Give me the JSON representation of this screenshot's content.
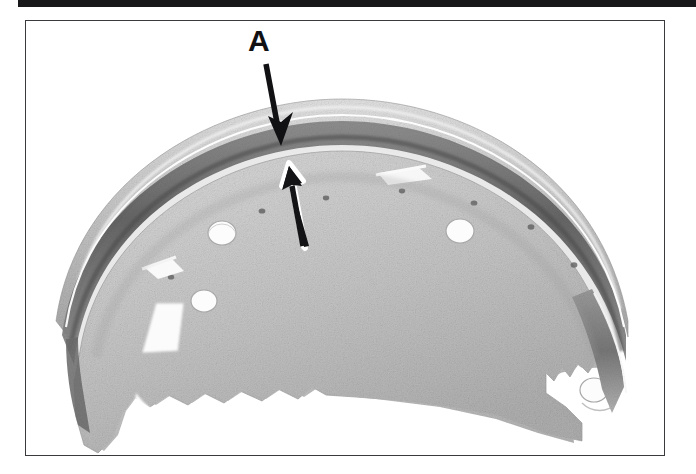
{
  "figure": {
    "kind": "photograph",
    "caption_visible": false,
    "callouts": [
      {
        "id": "A",
        "label": "A",
        "label_x": 262,
        "label_y": 42,
        "arrows": [
          {
            "name": "callout-a-down-arrow",
            "direction": "down",
            "style": "solid-black",
            "from_x": 266,
            "from_y": 64,
            "to_x": 281,
            "to_y": 145
          },
          {
            "name": "callout-a-up-arrow",
            "direction": "up",
            "style": "black-with-white-outline",
            "from_x": 304,
            "from_y": 247,
            "to_x": 288,
            "to_y": 167
          }
        ]
      }
    ]
  },
  "frame": {
    "border_color": "#3a3a3e",
    "left": 25,
    "top": 20,
    "width": 640,
    "height": 436
  },
  "top_rule": {
    "color": "#18181a",
    "left": 18,
    "top": 0,
    "width": 678,
    "height": 7
  },
  "palette": {
    "page_background": "#ffffff",
    "rule_black": "#18181a",
    "frame_border": "#3a3a3e",
    "label_black": "#111114",
    "lining_light": "#d7d7d7",
    "lining_mid": "#bdbdbd",
    "web_light": "#cfcfcf",
    "web_mid": "#b4b4b4",
    "rim_dark": "#6e6e6e",
    "shadow_dark": "#3c3c3c",
    "hole_white": "#ffffff"
  },
  "shoe": {
    "description": "Curved brake shoe seen from the side: an arched friction lining along the outer edge, a dark shadowed rim beneath it, and a flat perforated web plate with round mounting holes and notched cutouts.",
    "holes": [
      {
        "name": "hole-upper-left",
        "cx": 196,
        "cy": 212,
        "r": 13
      },
      {
        "name": "hole-mid-left",
        "cx": 178,
        "cy": 278,
        "r": 12
      },
      {
        "name": "hole-upper-right",
        "cx": 434,
        "cy": 210,
        "r": 13
      },
      {
        "name": "hole-lower-right",
        "cx": 568,
        "cy": 369,
        "r": 13
      },
      {
        "name": "cutout-triangle-left",
        "cx": 142,
        "cy": 305,
        "r": 0
      }
    ],
    "rivets": [
      {
        "cx": 236,
        "cy": 190
      },
      {
        "cx": 300,
        "cy": 177
      },
      {
        "cx": 376,
        "cy": 170
      },
      {
        "cx": 448,
        "cy": 180
      },
      {
        "cx": 505,
        "cy": 205
      },
      {
        "cx": 145,
        "cy": 258
      }
    ]
  }
}
